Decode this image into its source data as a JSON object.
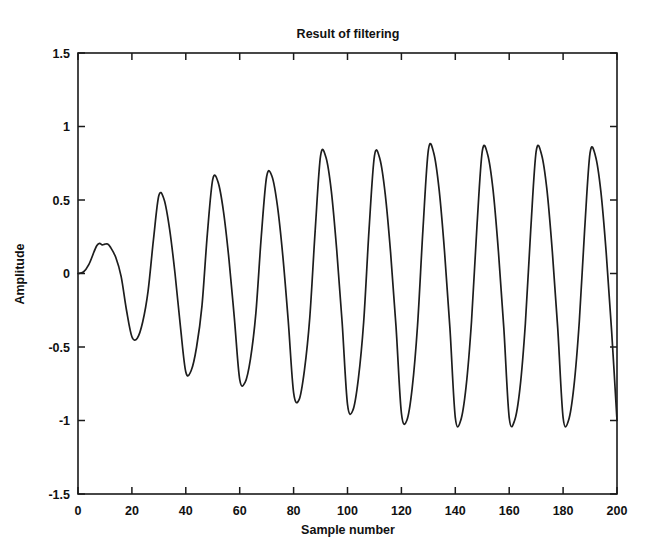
{
  "chart_data": {
    "type": "line",
    "title": "Result of filtering",
    "xlabel": "Sample number",
    "ylabel": "Amplitude",
    "xlim": [
      0,
      200
    ],
    "ylim": [
      -1.5,
      1.5
    ],
    "xticks": [
      0,
      20,
      40,
      60,
      80,
      100,
      120,
      140,
      160,
      180,
      200
    ],
    "yticks": [
      -1.5,
      -1,
      -0.5,
      0,
      0.5,
      1,
      1.5
    ],
    "xticklabels": [
      "0",
      "20",
      "40",
      "60",
      "80",
      "100",
      "120",
      "140",
      "160",
      "180",
      "200"
    ],
    "yticklabels": [
      "-1.5",
      "-1",
      "-0.5",
      "0",
      "0.5",
      "1",
      "1.5"
    ],
    "grid": false,
    "legend": null,
    "line_color": "#1d1d1d",
    "background_color": "#ffffff",
    "series": [
      {
        "name": "filtered signal",
        "x": [
          0,
          2,
          4,
          6,
          7,
          8,
          9,
          10,
          11,
          12,
          14,
          16,
          18,
          20,
          22,
          24,
          26,
          28,
          30,
          32,
          34,
          36,
          38,
          40,
          42,
          44,
          46,
          48,
          50,
          52,
          54,
          56,
          58,
          60,
          62,
          64,
          66,
          68,
          70,
          72,
          74,
          76,
          78,
          80,
          82,
          84,
          86,
          88,
          90,
          92,
          94,
          96,
          98,
          100,
          102,
          104,
          106,
          108,
          110,
          112,
          114,
          116,
          118,
          120,
          122,
          124,
          126,
          128,
          130,
          132,
          134,
          136,
          138,
          140,
          142,
          144,
          146,
          148,
          150,
          152,
          154,
          156,
          158,
          160,
          162,
          164,
          166,
          168,
          170,
          172,
          174,
          176,
          178,
          180,
          182,
          184,
          186,
          188,
          190,
          192,
          194,
          196,
          198,
          200
        ],
        "y": [
          0.0,
          0.01,
          0.06,
          0.15,
          0.19,
          0.205,
          0.195,
          0.2,
          0.2,
          0.18,
          0.11,
          -0.02,
          -0.25,
          -0.43,
          -0.44,
          -0.33,
          -0.12,
          0.23,
          0.53,
          0.5,
          0.3,
          0.0,
          -0.36,
          -0.67,
          -0.66,
          -0.5,
          -0.22,
          0.27,
          0.64,
          0.62,
          0.42,
          0.1,
          -0.3,
          -0.72,
          -0.74,
          -0.58,
          -0.27,
          0.25,
          0.66,
          0.66,
          0.46,
          0.12,
          -0.32,
          -0.81,
          -0.86,
          -0.66,
          -0.3,
          0.29,
          0.8,
          0.79,
          0.56,
          0.16,
          -0.33,
          -0.89,
          -0.93,
          -0.72,
          -0.33,
          0.3,
          0.8,
          0.78,
          0.54,
          0.14,
          -0.36,
          -0.95,
          -1.0,
          -0.78,
          -0.35,
          0.3,
          0.84,
          0.82,
          0.57,
          0.15,
          -0.37,
          -0.98,
          -1.0,
          -0.77,
          -0.33,
          0.31,
          0.83,
          0.81,
          0.57,
          0.15,
          -0.37,
          -0.98,
          -1.0,
          -0.78,
          -0.34,
          0.3,
          0.83,
          0.81,
          0.57,
          0.15,
          -0.37,
          -0.98,
          -1.0,
          -0.77,
          -0.33,
          0.3,
          0.82,
          0.8,
          0.56,
          0.14,
          -0.39,
          -1.0
        ]
      }
    ]
  }
}
